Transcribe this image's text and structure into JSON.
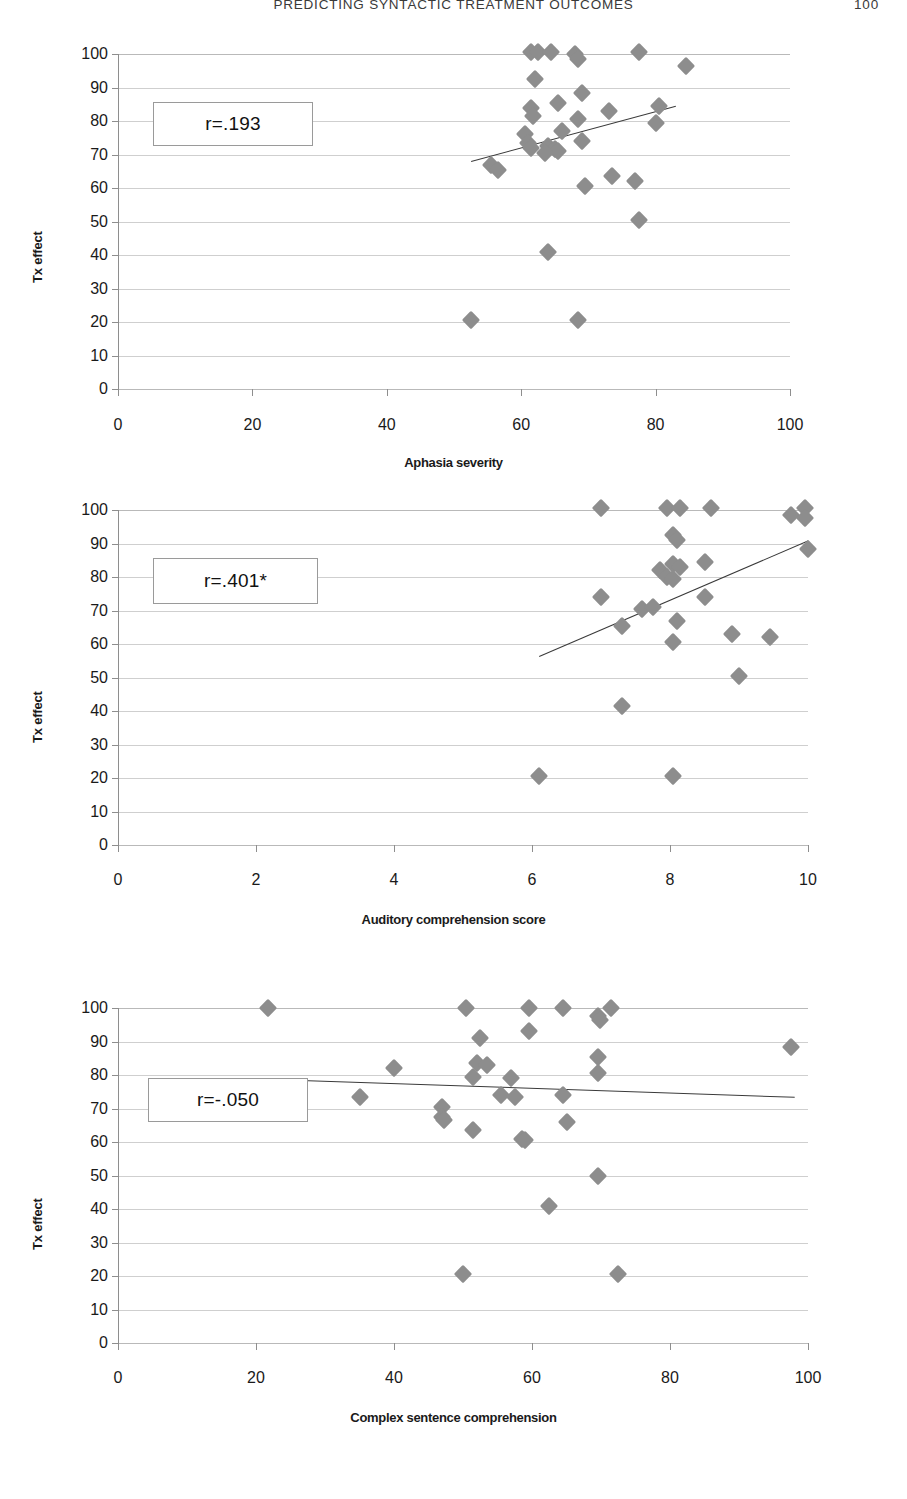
{
  "header": {
    "running_head": "PREDICTING SYNTACTIC TREATMENT OUTCOMES",
    "page_number": "100"
  },
  "chart_data": [
    {
      "id": "chart-aphasia-severity",
      "type": "scatter",
      "title": "",
      "xlabel": "Aphasia severity",
      "ylabel": "Tx effect",
      "annotation": "r=.193",
      "xlim": [
        0,
        100
      ],
      "ylim": [
        0,
        100
      ],
      "xticks": [
        0,
        20,
        40,
        60,
        80,
        100
      ],
      "yticks": [
        0,
        10,
        20,
        30,
        40,
        50,
        60,
        70,
        80,
        90,
        100
      ],
      "grid": true,
      "legend": "none",
      "marker": "diamond",
      "marker_color": "#8d8d8d",
      "trendline": {
        "x0": 52.5,
        "y0": 68.0,
        "x1": 83.0,
        "y1": 84.5
      },
      "points": [
        {
          "x": 61.5,
          "y": 100.5
        },
        {
          "x": 62.5,
          "y": 100.5
        },
        {
          "x": 64.5,
          "y": 100.5
        },
        {
          "x": 68.0,
          "y": 100.0
        },
        {
          "x": 68.5,
          "y": 98.5
        },
        {
          "x": 77.5,
          "y": 100.5
        },
        {
          "x": 84.5,
          "y": 96.5
        },
        {
          "x": 62.0,
          "y": 92.5
        },
        {
          "x": 61.5,
          "y": 84.0
        },
        {
          "x": 61.8,
          "y": 81.5
        },
        {
          "x": 65.5,
          "y": 85.5
        },
        {
          "x": 69.0,
          "y": 88.5
        },
        {
          "x": 73.0,
          "y": 83.0
        },
        {
          "x": 80.5,
          "y": 84.5
        },
        {
          "x": 80.0,
          "y": 79.5
        },
        {
          "x": 68.5,
          "y": 80.5
        },
        {
          "x": 60.5,
          "y": 76.0
        },
        {
          "x": 61.0,
          "y": 73.5
        },
        {
          "x": 66.0,
          "y": 77.0
        },
        {
          "x": 61.5,
          "y": 72.0
        },
        {
          "x": 64.0,
          "y": 72.5
        },
        {
          "x": 65.0,
          "y": 71.5
        },
        {
          "x": 65.5,
          "y": 71.0
        },
        {
          "x": 63.5,
          "y": 70.5
        },
        {
          "x": 69.0,
          "y": 74.0
        },
        {
          "x": 55.5,
          "y": 67.0
        },
        {
          "x": 56.5,
          "y": 65.5
        },
        {
          "x": 69.5,
          "y": 60.5
        },
        {
          "x": 73.5,
          "y": 63.5
        },
        {
          "x": 77.0,
          "y": 62.0
        },
        {
          "x": 77.5,
          "y": 50.5
        },
        {
          "x": 64.0,
          "y": 41.0
        },
        {
          "x": 52.5,
          "y": 20.5
        },
        {
          "x": 68.5,
          "y": 20.5
        }
      ]
    },
    {
      "id": "chart-auditory-comprehension",
      "type": "scatter",
      "title": "",
      "xlabel": "Auditory comprehension score",
      "ylabel": "Tx effect",
      "annotation": "r=.401*",
      "xlim": [
        0,
        10
      ],
      "ylim": [
        0,
        100
      ],
      "xticks": [
        0,
        2,
        4,
        6,
        8,
        10
      ],
      "yticks": [
        0,
        10,
        20,
        30,
        40,
        50,
        60,
        70,
        80,
        90,
        100
      ],
      "grid": true,
      "legend": "none",
      "marker": "diamond",
      "marker_color": "#8d8d8d",
      "trendline": {
        "x0": 6.1,
        "y0": 56.5,
        "x1": 10.0,
        "y1": 91.0
      },
      "points": [
        {
          "x": 7.0,
          "y": 100.5
        },
        {
          "x": 7.95,
          "y": 100.5
        },
        {
          "x": 8.15,
          "y": 100.5
        },
        {
          "x": 8.6,
          "y": 100.5
        },
        {
          "x": 9.95,
          "y": 100.5
        },
        {
          "x": 9.75,
          "y": 98.5
        },
        {
          "x": 9.95,
          "y": 97.5
        },
        {
          "x": 10.0,
          "y": 88.5
        },
        {
          "x": 8.05,
          "y": 92.5
        },
        {
          "x": 8.1,
          "y": 91.0
        },
        {
          "x": 8.05,
          "y": 84.0
        },
        {
          "x": 8.15,
          "y": 83.0
        },
        {
          "x": 7.85,
          "y": 82.0
        },
        {
          "x": 8.5,
          "y": 84.5
        },
        {
          "x": 7.95,
          "y": 80.0
        },
        {
          "x": 8.05,
          "y": 79.5
        },
        {
          "x": 8.5,
          "y": 74.0
        },
        {
          "x": 7.0,
          "y": 74.0
        },
        {
          "x": 7.6,
          "y": 70.5
        },
        {
          "x": 7.75,
          "y": 71.0
        },
        {
          "x": 8.1,
          "y": 67.0
        },
        {
          "x": 7.3,
          "y": 65.5
        },
        {
          "x": 8.05,
          "y": 60.5
        },
        {
          "x": 8.9,
          "y": 63.0
        },
        {
          "x": 9.45,
          "y": 62.0
        },
        {
          "x": 9.0,
          "y": 50.5
        },
        {
          "x": 7.3,
          "y": 41.5
        },
        {
          "x": 6.1,
          "y": 20.5
        },
        {
          "x": 8.05,
          "y": 20.5
        }
      ]
    },
    {
      "id": "chart-complex-sentence-comprehension",
      "type": "scatter",
      "title": "",
      "xlabel": "Complex sentence comprehension",
      "ylabel": "Tx effect",
      "annotation": "r=-.050",
      "xlim": [
        0,
        100
      ],
      "ylim": [
        0,
        100
      ],
      "xticks": [
        0,
        20,
        40,
        60,
        80,
        100
      ],
      "yticks": [
        0,
        10,
        20,
        30,
        40,
        50,
        60,
        70,
        80,
        90,
        100
      ],
      "grid": true,
      "legend": "none",
      "marker": "diamond",
      "marker_color": "#8d8d8d",
      "trendline": {
        "x0": 26.5,
        "y0": 78.5,
        "x1": 98.0,
        "y1": 73.5
      },
      "points": [
        {
          "x": 21.8,
          "y": 100.0
        },
        {
          "x": 50.5,
          "y": 100.0
        },
        {
          "x": 59.5,
          "y": 100.0
        },
        {
          "x": 64.5,
          "y": 100.0
        },
        {
          "x": 71.5,
          "y": 100.0
        },
        {
          "x": 69.5,
          "y": 97.5
        },
        {
          "x": 69.8,
          "y": 96.5
        },
        {
          "x": 52.5,
          "y": 91.0
        },
        {
          "x": 59.5,
          "y": 93.0
        },
        {
          "x": 97.5,
          "y": 88.5
        },
        {
          "x": 40.0,
          "y": 82.0
        },
        {
          "x": 52.0,
          "y": 83.5
        },
        {
          "x": 53.5,
          "y": 83.0
        },
        {
          "x": 69.5,
          "y": 85.5
        },
        {
          "x": 69.5,
          "y": 80.5
        },
        {
          "x": 35.0,
          "y": 73.5
        },
        {
          "x": 47.0,
          "y": 70.5
        },
        {
          "x": 51.5,
          "y": 79.5
        },
        {
          "x": 57.0,
          "y": 79.0
        },
        {
          "x": 55.5,
          "y": 74.0
        },
        {
          "x": 57.5,
          "y": 73.5
        },
        {
          "x": 64.5,
          "y": 74.0
        },
        {
          "x": 47.0,
          "y": 67.5
        },
        {
          "x": 47.3,
          "y": 66.5
        },
        {
          "x": 51.5,
          "y": 63.5
        },
        {
          "x": 58.5,
          "y": 61.0
        },
        {
          "x": 59.0,
          "y": 60.5
        },
        {
          "x": 65.0,
          "y": 66.0
        },
        {
          "x": 69.5,
          "y": 50.0
        },
        {
          "x": 62.5,
          "y": 41.0
        },
        {
          "x": 50.0,
          "y": 20.5
        },
        {
          "x": 72.5,
          "y": 20.5
        }
      ]
    }
  ],
  "figures": [
    {
      "annotation_box": {
        "label": "r=.193"
      },
      "axis_titles": {
        "x": "Aphasia severity",
        "y": "Tx effect"
      }
    },
    {
      "annotation_box": {
        "label": "r=.401*"
      },
      "axis_titles": {
        "x": "Auditory comprehension score",
        "y": "Tx effect"
      }
    },
    {
      "annotation_box": {
        "label": "r=-.050"
      },
      "axis_titles": {
        "x": "Complex sentence comprehension",
        "y": "Tx effect"
      }
    }
  ]
}
